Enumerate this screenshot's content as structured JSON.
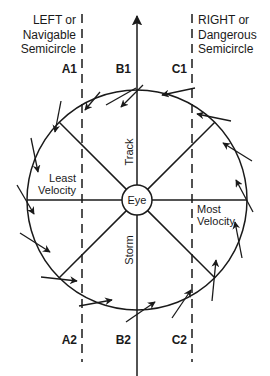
{
  "diagram": {
    "left_heading": [
      "LEFT or",
      "Navigable",
      "Semicircle"
    ],
    "right_heading": [
      "RIGHT or",
      "Dangerous",
      "Semicircle"
    ],
    "line_labels_top": [
      "A1",
      "B1",
      "C1"
    ],
    "line_labels_bottom": [
      "A2",
      "B2",
      "C2"
    ],
    "center_label": "Eye",
    "track_label": "Track",
    "storm_label": "Storm",
    "least_velocity": [
      "Least",
      "Velocity"
    ],
    "most_velocity": [
      "Most",
      "Velocity"
    ],
    "colors": {
      "line": "#1a1a1a",
      "background": "#ffffff"
    }
  }
}
